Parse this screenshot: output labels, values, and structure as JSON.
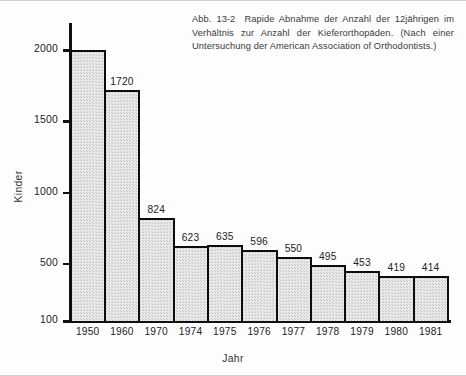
{
  "caption": {
    "figure_number": "Abb. 13-2",
    "text": "Rapide Abnahme der Anzahl der 12jährigen im Verhältnis zur Anzahl der Kieferorthopäden. (Nach einer Untersuchung der American Association of Orthodontists.)"
  },
  "chart_data": {
    "type": "bar",
    "title": "",
    "xlabel": "Jahr",
    "ylabel": "Kinder",
    "categories": [
      "1950",
      "1960",
      "1970",
      "1974",
      "1975",
      "1976",
      "1977",
      "1978",
      "1979",
      "1980",
      "1981"
    ],
    "values": [
      2000,
      1720,
      824,
      623,
      635,
      596,
      550,
      495,
      453,
      419,
      414
    ],
    "data_labels": [
      "",
      "1720",
      "824",
      "623",
      "635",
      "596",
      "550",
      "495",
      "453",
      "419",
      "414"
    ],
    "ytick_labels": [
      "2000",
      "1500",
      "1000",
      "500",
      "100"
    ],
    "ytick_values": [
      2000,
      1500,
      1000,
      500,
      100
    ],
    "ylim": [
      100,
      2120
    ],
    "grid": false,
    "legend": null,
    "bar_fill_color": "#e9e9e9",
    "bar_edge_color": "#0d0d0d",
    "axis_color": "#111111",
    "background_color": "#ffffff"
  }
}
